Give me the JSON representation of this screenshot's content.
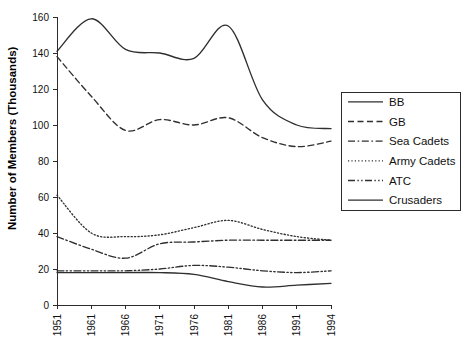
{
  "chart_data": {
    "type": "line",
    "title": "",
    "xlabel": "",
    "ylabel": "Number of Members (Thousands)",
    "categories": [
      "1951",
      "1961",
      "1966",
      "1971",
      "1976",
      "1981",
      "1986",
      "1991",
      "1994"
    ],
    "x": [
      1951,
      1961,
      1966,
      1971,
      1976,
      1981,
      1986,
      1991,
      1994
    ],
    "xlim": [
      1951,
      1994
    ],
    "ylim": [
      0,
      160
    ],
    "yticks": [
      0,
      20,
      40,
      60,
      80,
      100,
      120,
      140,
      160
    ],
    "ytick_labels": [
      "0",
      "20",
      "40",
      "60",
      "80",
      "100",
      "120",
      "140",
      "160"
    ],
    "grid": false,
    "legend_position": "right",
    "smoothing": "spline",
    "series": [
      {
        "name": "BB",
        "dash": "solid",
        "values": [
          141,
          159,
          142,
          140,
          137,
          155,
          114,
          100,
          98
        ]
      },
      {
        "name": "GB",
        "dash": "dashed",
        "values": [
          138,
          116,
          97,
          103,
          100,
          104,
          93,
          88,
          91
        ]
      },
      {
        "name": "Sea Cadets",
        "dash": "dash-dot",
        "values": [
          38,
          31,
          26,
          34,
          35,
          36,
          36,
          36,
          36
        ]
      },
      {
        "name": "Army Cadets",
        "dash": "dotted",
        "values": [
          61,
          40,
          38,
          39,
          43,
          47,
          42,
          38,
          36
        ]
      },
      {
        "name": "ATC",
        "dash": "dash-dot-dot",
        "values": [
          19,
          19,
          19,
          20,
          22,
          21,
          19,
          18,
          19
        ]
      },
      {
        "name": "Crusaders",
        "dash": "solid-thin",
        "values": [
          18,
          18,
          18,
          18,
          17,
          13,
          10,
          11,
          12
        ]
      }
    ]
  },
  "legend": {
    "entries": [
      {
        "label": "BB"
      },
      {
        "label": "GB"
      },
      {
        "label": "Sea Cadets"
      },
      {
        "label": "Army Cadets"
      },
      {
        "label": "ATC"
      },
      {
        "label": "Crusaders"
      }
    ]
  },
  "colors": {
    "line": "#2f2f2f",
    "axis": "#2b2b2b",
    "text": "#111111",
    "background": "#ffffff"
  }
}
